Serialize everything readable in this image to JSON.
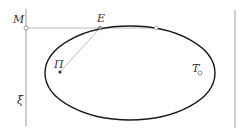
{
  "diagram": {
    "labels": {
      "M": "M",
      "E": "E",
      "Pi": "Π",
      "T": "T",
      "xi": "ξ"
    },
    "colors": {
      "ellipse": "#1a1a1a",
      "construction_line": "#bdbdbd",
      "directrix": "#9a9a9a",
      "text": "#333333"
    }
  }
}
